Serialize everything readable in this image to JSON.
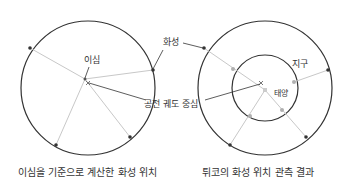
{
  "left_panel": {
    "caption": "이심을 기준으로 계산한 화성 위치",
    "labels": {
      "eccentric": "이심",
      "mars": "화성",
      "orbit_center": "공전 궤도 중심"
    }
  },
  "right_panel": {
    "caption": "튀코의 화성 위치 관측 결과",
    "labels": {
      "earth": "지구",
      "sun": "태양"
    }
  },
  "colors": {
    "orbit": "#333333",
    "ray": "#c8c8c8",
    "point": "#333333",
    "earth_point": "#b0b0b0",
    "sun": "#cccccc"
  }
}
